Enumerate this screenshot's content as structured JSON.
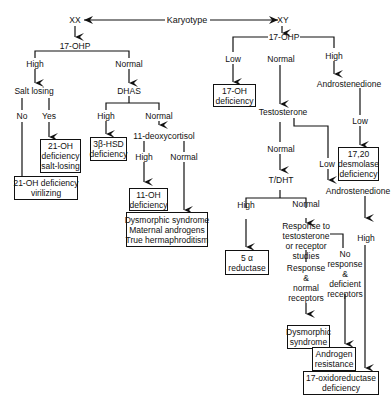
{
  "diagram": {
    "type": "flowchart",
    "root": "Karyotype",
    "nodes": {
      "karyotype": "Karyotype",
      "xx": "XX",
      "xy": "XY",
      "xx_17ohp": "17-OHP",
      "xx_high": "High",
      "xx_normal": "Normal",
      "salt_losing": "Salt losing",
      "no": "No",
      "yes": "Yes",
      "dhas": "DHAS",
      "dhas_high": "High",
      "dhas_normal": "Normal",
      "deoxycortisol": "11-deoxycortisol",
      "deoxy_high": "High",
      "deoxy_normal": "Normal",
      "xy_17ohp": "17-OHP",
      "xy_low": "Low",
      "xy_normal": "Normal",
      "xy_high": "High",
      "androstenedione_1": "Androstenedione",
      "andro_low": "Low",
      "testosterone": "Testosterone",
      "testo_normal": "Normal",
      "testo_low": "Low",
      "t_dht": "T/DHT",
      "tdht_high": "High",
      "tdht_normal": "Normal",
      "androstenedione_2": "Androstenedione",
      "andro2_high": "High"
    },
    "boxes": {
      "oh21_salt": [
        "21-OH",
        "deficiency",
        "salt-losing"
      ],
      "oh21_vir": [
        "21-OH deficiency",
        "virilizing"
      ],
      "hsd3b": [
        "3β-HSD",
        "deficiency"
      ],
      "oh11": [
        "11-OH",
        "deficiency"
      ],
      "dysmorphic_xx": [
        "Dysmorphic syndrome",
        "Maternal androgens",
        "True hermaphroditism"
      ],
      "oh17": [
        "17-OH",
        "deficiency"
      ],
      "desmolase": [
        "17,20",
        "desmolase",
        "deficiency"
      ],
      "reductase5a": [
        "5 α",
        "reductase"
      ],
      "dysmorphic_xy": [
        "Dysmorphic",
        "syndrome"
      ],
      "androgen_res": [
        "Androgen",
        "resistance"
      ],
      "oxidoreductase": [
        "17-oxidoreductase",
        "deficiency"
      ]
    },
    "multiline_labels": {
      "response_to": [
        "Response to",
        "testosterone",
        "or receptor",
        "studies"
      ],
      "response_normal": [
        "Response",
        "&",
        "normal",
        "receptors"
      ],
      "no_response": [
        "No",
        "response",
        "&",
        "deficient",
        "receptors"
      ]
    }
  }
}
